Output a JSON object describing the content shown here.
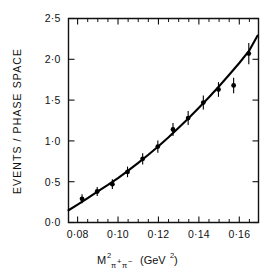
{
  "chart_data": {
    "type": "scatter",
    "title": "",
    "xlabel": "M²π+π− (GeV²)",
    "ylabel": "EVENTS / PHASE SPACE",
    "xlim": [
      0.0755,
      0.1695
    ],
    "ylim": [
      0.0,
      2.5
    ],
    "grid": false,
    "legend": "none",
    "x_ticks_major": [
      0.08,
      0.1,
      0.12,
      0.14,
      0.16
    ],
    "x_tick_labels": [
      "0·08",
      "0·10",
      "0·12",
      "0·14",
      "0·16"
    ],
    "x_ticks_minor": [
      0.085,
      0.09,
      0.095,
      0.105,
      0.11,
      0.115,
      0.125,
      0.13,
      0.135,
      0.145,
      0.15,
      0.155,
      0.165
    ],
    "y_ticks_major": [
      0.0,
      0.5,
      1.0,
      1.5,
      2.0,
      2.5
    ],
    "y_tick_labels": [
      "0·0",
      "0·5",
      "1·0",
      "1·5",
      "2·0",
      "2·5"
    ],
    "series": [
      {
        "name": "data",
        "marker": "filled-circle",
        "x": [
          0.0822,
          0.0897,
          0.0972,
          0.1047,
          0.1122,
          0.1197,
          0.1272,
          0.1347,
          0.1422,
          0.1497,
          0.1572,
          0.1647
        ],
        "values": [
          0.29,
          0.38,
          0.47,
          0.62,
          0.78,
          0.93,
          1.14,
          1.28,
          1.47,
          1.63,
          1.68,
          2.07
        ],
        "yerr": [
          0.055,
          0.055,
          0.06,
          0.065,
          0.07,
          0.075,
          0.08,
          0.085,
          0.085,
          0.09,
          0.095,
          0.13
        ]
      },
      {
        "name": "fit-curve",
        "marker": "line",
        "x": [
          0.0755,
          0.08,
          0.085,
          0.09,
          0.095,
          0.1,
          0.105,
          0.11,
          0.115,
          0.12,
          0.125,
          0.13,
          0.135,
          0.14,
          0.145,
          0.15,
          0.155,
          0.16,
          0.165,
          0.169
        ],
        "values": [
          0.15,
          0.22,
          0.3,
          0.38,
          0.46,
          0.545,
          0.635,
          0.73,
          0.83,
          0.935,
          1.045,
          1.16,
          1.28,
          1.405,
          1.535,
          1.67,
          1.81,
          1.955,
          2.11,
          2.29
        ]
      }
    ]
  },
  "labels": {
    "y_axis_title": "EVENTS / PHASE SPACE",
    "x_axis_title_main": "M",
    "x_axis_title_exp": "2",
    "x_axis_title_sub_a": "π",
    "x_axis_title_sub_a_sup": "+",
    "x_axis_title_sub_b": "π",
    "x_axis_title_sub_b_sup": "−",
    "x_axis_title_units": "(GeV",
    "x_axis_title_units_exp": "2",
    "x_axis_title_units_close": ")"
  },
  "colors": {
    "axis": "#111111",
    "curve": "#000000",
    "marker": "#000000",
    "background": "#ffffff"
  }
}
